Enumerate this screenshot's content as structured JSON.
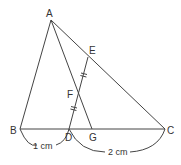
{
  "diagram": {
    "type": "geometry-triangle",
    "points": {
      "A": {
        "label": "A",
        "x": 51,
        "y": 20
      },
      "B": {
        "label": "B",
        "x": 20,
        "y": 129
      },
      "C": {
        "label": "C",
        "x": 165,
        "y": 129
      },
      "D": {
        "label": "D",
        "x": 69,
        "y": 129
      },
      "G": {
        "label": "G",
        "x": 92,
        "y": 129
      },
      "E": {
        "label": "E",
        "x": 88,
        "y": 57
      },
      "F": {
        "label": "F",
        "x": 79,
        "y": 91
      }
    },
    "segments": [
      "AB",
      "AC",
      "BC",
      "AG",
      "DE"
    ],
    "equal_marks": [
      "EF",
      "FD"
    ],
    "dimensions": [
      {
        "from": "B",
        "to": "D",
        "label": "1 cm"
      },
      {
        "from": "D",
        "to": "C",
        "label": "2 cm"
      }
    ],
    "colors": {
      "line": "#444444",
      "text": "#333333",
      "background": "#ffffff"
    }
  }
}
